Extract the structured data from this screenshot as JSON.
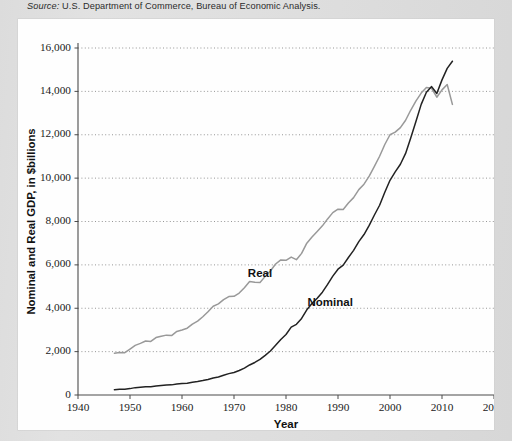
{
  "source": {
    "keyword": "Source:",
    "text": " U.S. Department of Commerce, Bureau of Economic Analysis."
  },
  "chart_data": {
    "type": "line",
    "title": "",
    "xlabel": "Year",
    "ylabel": "Nominal and Real GDP, in $billions",
    "xlim": [
      1940,
      2020
    ],
    "ylim": [
      0,
      16000
    ],
    "xticks": [
      1940,
      1950,
      1960,
      1970,
      1980,
      1990,
      2000,
      2010,
      2020
    ],
    "xtick_labels": [
      "1940",
      "1950",
      "1960",
      "1970",
      "1980",
      "1990",
      "2000",
      "2010",
      "2020"
    ],
    "yticks": [
      0,
      2000,
      4000,
      6000,
      8000,
      10000,
      12000,
      14000,
      16000
    ],
    "ytick_labels": [
      "0",
      "2,000",
      "4,000",
      "6,000",
      "8,000",
      "10,000",
      "12,000",
      "14,000",
      "16,000"
    ],
    "grid": "horizontal-dotted",
    "legend_position": "inline-annotations",
    "series": [
      {
        "name": "Real",
        "label": "Real",
        "color": "#999999",
        "label_x": 1975.0,
        "label_y": 5450,
        "x": [
          1947,
          1948,
          1949,
          1950,
          1951,
          1952,
          1953,
          1954,
          1955,
          1956,
          1957,
          1958,
          1959,
          1960,
          1961,
          1962,
          1963,
          1964,
          1965,
          1966,
          1967,
          1968,
          1969,
          1970,
          1971,
          1972,
          1973,
          1974,
          1975,
          1976,
          1977,
          1978,
          1979,
          1980,
          1981,
          1982,
          1983,
          1984,
          1985,
          1986,
          1987,
          1988,
          1989,
          1990,
          1991,
          1992,
          1993,
          1994,
          1995,
          1996,
          1997,
          1998,
          1999,
          2000,
          2001,
          2002,
          2003,
          2004,
          2005,
          2006,
          2007,
          2008,
          2009,
          2010,
          2011,
          2012
        ],
        "values": [
          1930,
          1960,
          1950,
          2120,
          2290,
          2380,
          2490,
          2470,
          2650,
          2710,
          2760,
          2740,
          2930,
          3000,
          3080,
          3270,
          3410,
          3610,
          3840,
          4090,
          4200,
          4400,
          4540,
          4550,
          4700,
          4950,
          5230,
          5200,
          5190,
          5470,
          5720,
          6040,
          6230,
          6210,
          6360,
          6240,
          6530,
          7000,
          7290,
          7540,
          7800,
          8120,
          8410,
          8570,
          8550,
          8850,
          9100,
          9470,
          9720,
          10090,
          10540,
          11010,
          11550,
          12000,
          12120,
          12330,
          12670,
          13140,
          13560,
          13920,
          14180,
          14140,
          13730,
          14070,
          14320,
          13400
        ]
      },
      {
        "name": "Nominal",
        "label": "Nominal",
        "color": "#222222",
        "label_x": 1988.5,
        "label_y": 4100,
        "x": [
          1947,
          1948,
          1949,
          1950,
          1951,
          1952,
          1953,
          1954,
          1955,
          1956,
          1957,
          1958,
          1959,
          1960,
          1961,
          1962,
          1963,
          1964,
          1965,
          1966,
          1967,
          1968,
          1969,
          1970,
          1971,
          1972,
          1973,
          1974,
          1975,
          1976,
          1977,
          1978,
          1979,
          1980,
          1981,
          1982,
          1983,
          1984,
          1985,
          1986,
          1987,
          1988,
          1989,
          1990,
          1991,
          1992,
          1993,
          1994,
          1995,
          1996,
          1997,
          1998,
          1999,
          2000,
          2001,
          2002,
          2003,
          2004,
          2005,
          2006,
          2007,
          2008,
          2009,
          2010,
          2011,
          2012
        ],
        "values": [
          245,
          270,
          268,
          294,
          340,
          360,
          380,
          381,
          415,
          438,
          461,
          467,
          507,
          527,
          545,
          586,
          618,
          664,
          719,
          788,
          833,
          911,
          985,
          1040,
          1130,
          1240,
          1385,
          1500,
          1640,
          1830,
          2030,
          2290,
          2560,
          2790,
          3130,
          3260,
          3530,
          3930,
          4220,
          4460,
          4740,
          5100,
          5480,
          5800,
          5990,
          6340,
          6670,
          7070,
          7400,
          7820,
          8300,
          8750,
          9350,
          9900,
          10290,
          10640,
          11140,
          11860,
          12620,
          13400,
          13960,
          14220,
          13900,
          14530,
          15060,
          15390
        ]
      }
    ]
  }
}
